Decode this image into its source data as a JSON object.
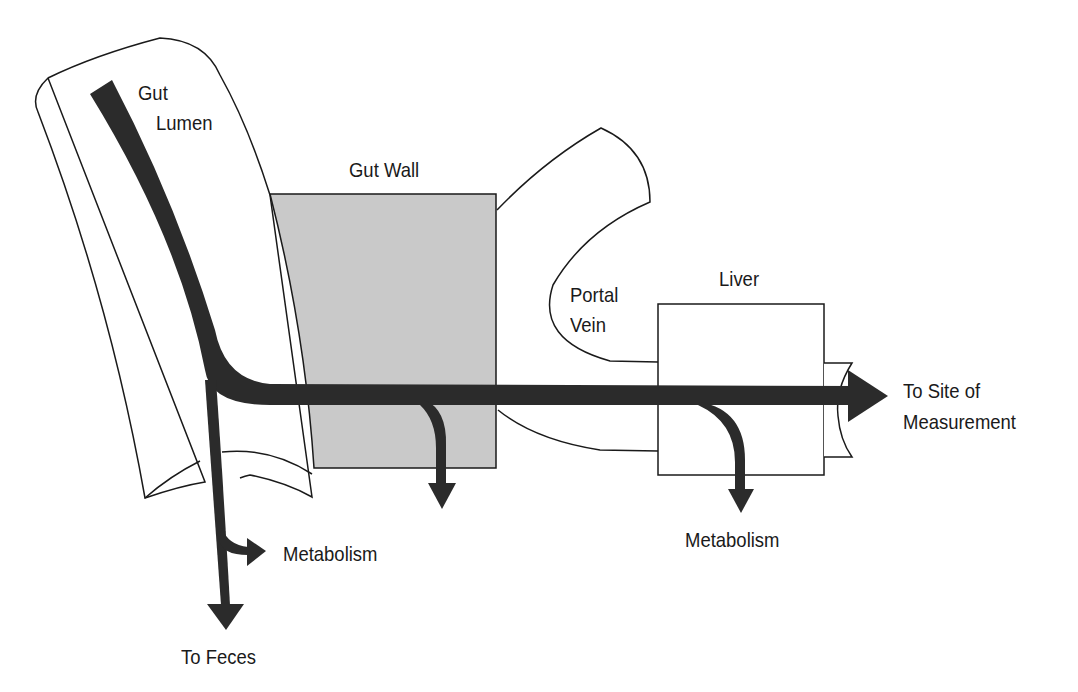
{
  "diagram": {
    "type": "pharmacokinetic flow diagram",
    "regions": {
      "gut_lumen": {
        "label_line1": "Gut",
        "label_line2": "Lumen"
      },
      "gut_wall": {
        "label": "Gut Wall"
      },
      "portal_vein": {
        "label_line1": "Portal",
        "label_line2": "Vein"
      },
      "liver": {
        "label": "Liver"
      }
    },
    "outputs": {
      "site": {
        "label_line1": "To Site of",
        "label_line2": "Measurement"
      },
      "lumen_metabolism": {
        "label": "Metabolism"
      },
      "liver_metabolism": {
        "label": "Metabolism"
      },
      "feces": {
        "label": "To Feces"
      }
    },
    "colors": {
      "flow": "#2b2b2b",
      "gut_wall_fill": "#c9c9c9",
      "outline": "#1a1a1a",
      "background": "#ffffff"
    }
  }
}
